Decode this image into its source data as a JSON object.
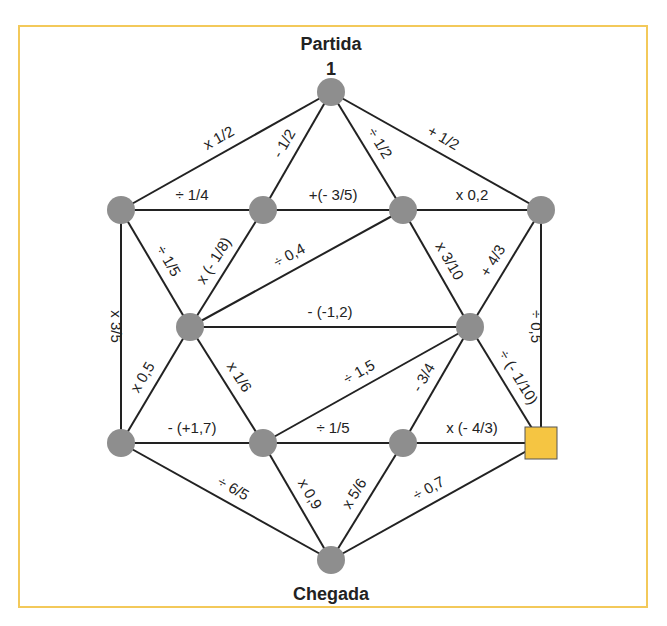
{
  "title_start": "Partida",
  "start_value": "1",
  "title_end": "Chegada",
  "colors": {
    "frame": "#f3c95a",
    "node": "#8e8e8e",
    "square": "#f5c542",
    "line": "#222222"
  },
  "nodes": [
    {
      "id": "start",
      "x": 331,
      "y": 92,
      "shape": "circle"
    },
    {
      "id": "l1",
      "x": 121,
      "y": 210,
      "shape": "circle"
    },
    {
      "id": "a",
      "x": 263,
      "y": 210,
      "shape": "circle"
    },
    {
      "id": "b",
      "x": 403,
      "y": 210,
      "shape": "circle"
    },
    {
      "id": "r1",
      "x": 541,
      "y": 210,
      "shape": "circle"
    },
    {
      "id": "c",
      "x": 190,
      "y": 327,
      "shape": "circle"
    },
    {
      "id": "d",
      "x": 470,
      "y": 327,
      "shape": "circle"
    },
    {
      "id": "l2",
      "x": 121,
      "y": 443,
      "shape": "circle"
    },
    {
      "id": "e",
      "x": 263,
      "y": 443,
      "shape": "circle"
    },
    {
      "id": "f",
      "x": 403,
      "y": 443,
      "shape": "circle"
    },
    {
      "id": "sq",
      "x": 541,
      "y": 443,
      "shape": "square"
    },
    {
      "id": "end",
      "x": 331,
      "y": 560,
      "shape": "circle"
    }
  ],
  "edges": [
    {
      "from": "start",
      "to": "l1",
      "label": "x 1/2"
    },
    {
      "from": "start",
      "to": "a",
      "label": "- 1/2"
    },
    {
      "from": "start",
      "to": "b",
      "label": "÷ 1/2"
    },
    {
      "from": "start",
      "to": "r1",
      "label": "+ 1/2"
    },
    {
      "from": "l1",
      "to": "a",
      "label": "÷ 1/4"
    },
    {
      "from": "a",
      "to": "b",
      "label": "+(- 3/5)"
    },
    {
      "from": "b",
      "to": "r1",
      "label": "x 0,2"
    },
    {
      "from": "l1",
      "to": "c",
      "label": "÷ 1/5"
    },
    {
      "from": "a",
      "to": "c",
      "label": "x (- 1/8)"
    },
    {
      "from": "b",
      "to": "c",
      "label": "÷ 0,4"
    },
    {
      "from": "b",
      "to": "d",
      "label": "x 3/10"
    },
    {
      "from": "r1",
      "to": "d",
      "label": "+ 4/3"
    },
    {
      "from": "c",
      "to": "d",
      "label": "- (-1,2)"
    },
    {
      "from": "l1",
      "to": "l2",
      "label": "x 3/5"
    },
    {
      "from": "r1",
      "to": "sq",
      "label": "÷ 0,5"
    },
    {
      "from": "c",
      "to": "l2",
      "label": "x 0,5"
    },
    {
      "from": "c",
      "to": "e",
      "label": "x 1/6"
    },
    {
      "from": "d",
      "to": "e",
      "label": "÷ 1,5"
    },
    {
      "from": "d",
      "to": "f",
      "label": "- 3/4"
    },
    {
      "from": "d",
      "to": "sq",
      "label": "÷ (- 1/10)"
    },
    {
      "from": "l2",
      "to": "e",
      "label": "- (+1,7)"
    },
    {
      "from": "e",
      "to": "f",
      "label": "÷ 1/5"
    },
    {
      "from": "f",
      "to": "sq",
      "label": "x (- 4/3)"
    },
    {
      "from": "l2",
      "to": "end",
      "label": "÷ 6/5"
    },
    {
      "from": "e",
      "to": "end",
      "label": "x 0,9"
    },
    {
      "from": "f",
      "to": "end",
      "label": "x 5/6"
    },
    {
      "from": "sq",
      "to": "end",
      "label": "÷ 0,7"
    }
  ]
}
